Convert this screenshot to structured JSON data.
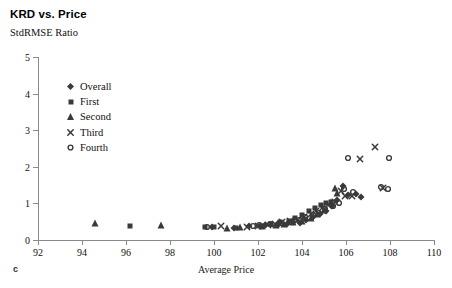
{
  "chart_data": {
    "type": "scatter",
    "title": "KRD vs. Price",
    "panel_letter": "c",
    "ylabel": "StdRMSE Ratio",
    "xlabel": "Average Price",
    "xlim": [
      92,
      110
    ],
    "ylim": [
      0,
      5
    ],
    "xticks": [
      92,
      94,
      96,
      98,
      100,
      102,
      104,
      106,
      108,
      110
    ],
    "yticks": [
      0,
      1,
      2,
      3,
      4,
      5
    ],
    "grid": false,
    "legend_position": "upper-left-inside",
    "marker_color": "#3a3a3a",
    "axis_color": "#8a8a8a",
    "series": [
      {
        "name": "Overall",
        "marker": "diamond",
        "points": [
          [
            99.9,
            0.36
          ],
          [
            100.9,
            0.34
          ],
          [
            101.6,
            0.37
          ],
          [
            102.3,
            0.4
          ],
          [
            102.9,
            0.42
          ],
          [
            103.3,
            0.45
          ],
          [
            103.6,
            0.5
          ],
          [
            103.9,
            0.47
          ],
          [
            104.2,
            0.55
          ],
          [
            104.5,
            0.62
          ],
          [
            104.8,
            0.7
          ],
          [
            105.1,
            0.8
          ],
          [
            105.35,
            0.92
          ],
          [
            105.6,
            1.1
          ],
          [
            105.85,
            1.48
          ],
          [
            106.1,
            1.22
          ],
          [
            106.45,
            1.25
          ],
          [
            106.7,
            1.18
          ]
        ]
      },
      {
        "name": "First",
        "marker": "square",
        "points": [
          [
            96.2,
            0.38
          ],
          [
            99.6,
            0.36
          ],
          [
            100.0,
            0.35
          ],
          [
            101.0,
            0.34
          ],
          [
            102.1,
            0.38
          ],
          [
            102.6,
            0.43
          ],
          [
            103.0,
            0.48
          ],
          [
            103.4,
            0.52
          ],
          [
            103.7,
            0.6
          ],
          [
            104.0,
            0.68
          ],
          [
            104.3,
            0.78
          ],
          [
            104.6,
            0.88
          ],
          [
            104.85,
            0.95
          ],
          [
            105.1,
            1.02
          ],
          [
            105.3,
            1.05
          ]
        ]
      },
      {
        "name": "Second",
        "marker": "triangle",
        "points": [
          [
            94.6,
            0.46
          ],
          [
            97.6,
            0.4
          ],
          [
            100.6,
            0.34
          ],
          [
            101.2,
            0.35
          ],
          [
            102.2,
            0.38
          ],
          [
            102.8,
            0.42
          ],
          [
            103.2,
            0.45
          ],
          [
            103.6,
            0.48
          ],
          [
            104.0,
            0.52
          ],
          [
            104.4,
            0.6
          ],
          [
            104.7,
            0.7
          ],
          [
            105.0,
            0.82
          ],
          [
            105.3,
            1.05
          ],
          [
            105.5,
            1.42
          ],
          [
            105.6,
            1.28
          ]
        ]
      },
      {
        "name": "Third",
        "marker": "cross",
        "points": [
          [
            100.3,
            0.37
          ],
          [
            101.5,
            0.36
          ],
          [
            102.0,
            0.39
          ],
          [
            102.45,
            0.42
          ],
          [
            102.75,
            0.45
          ],
          [
            103.1,
            0.48
          ],
          [
            103.45,
            0.52
          ],
          [
            103.8,
            0.56
          ],
          [
            104.1,
            0.62
          ],
          [
            104.4,
            0.72
          ],
          [
            104.65,
            0.8
          ],
          [
            104.9,
            0.88
          ],
          [
            105.2,
            0.95
          ],
          [
            105.5,
            1.05
          ],
          [
            105.75,
            1.35
          ],
          [
            105.95,
            1.2
          ],
          [
            106.25,
            1.2
          ],
          [
            106.65,
            2.2
          ],
          [
            107.3,
            2.55
          ],
          [
            107.7,
            1.42
          ]
        ]
      },
      {
        "name": "Fourth",
        "marker": "circle",
        "points": [
          [
            99.7,
            0.36
          ],
          [
            101.75,
            0.37
          ],
          [
            102.05,
            0.4
          ],
          [
            102.55,
            0.44
          ],
          [
            103.05,
            0.47
          ],
          [
            103.5,
            0.5
          ],
          [
            103.85,
            0.55
          ],
          [
            104.15,
            0.62
          ],
          [
            104.5,
            0.68
          ],
          [
            104.75,
            0.75
          ],
          [
            105.05,
            0.85
          ],
          [
            105.4,
            0.92
          ],
          [
            105.7,
            1.0
          ],
          [
            105.9,
            1.38
          ],
          [
            106.1,
            2.25
          ],
          [
            106.3,
            1.3
          ],
          [
            107.6,
            1.45
          ],
          [
            107.9,
            1.38
          ],
          [
            107.95,
            2.25
          ]
        ]
      }
    ]
  },
  "legend": {
    "items": [
      {
        "label": "Overall",
        "marker": "diamond"
      },
      {
        "label": "First",
        "marker": "square"
      },
      {
        "label": "Second",
        "marker": "triangle"
      },
      {
        "label": "Third",
        "marker": "cross"
      },
      {
        "label": "Fourth",
        "marker": "circle"
      }
    ]
  }
}
